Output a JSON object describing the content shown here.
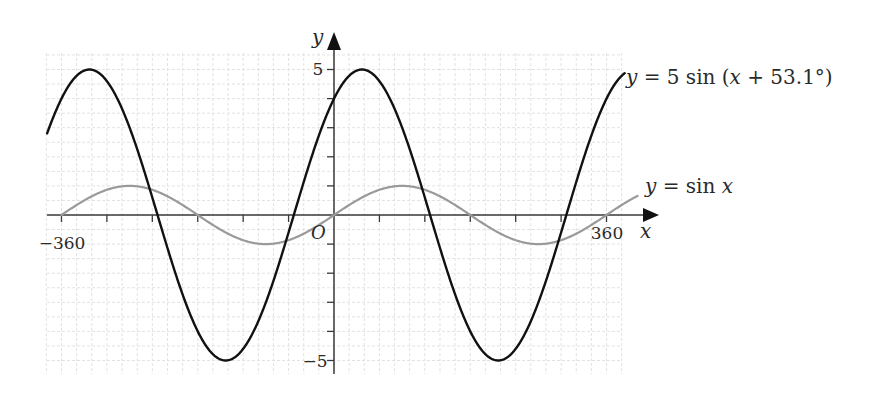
{
  "chart_data": {
    "type": "line",
    "title": "",
    "xlabel": "x",
    "ylabel": "y",
    "origin_label": "O",
    "xlim": [
      -380,
      380
    ],
    "ylim": [
      -5.5,
      5.5
    ],
    "x_tick_step_deg": 60,
    "x_tick_labels": [
      {
        "value": -360,
        "label": "−360"
      },
      {
        "value": 360,
        "label": "360"
      }
    ],
    "y_tick_step": 1,
    "y_tick_labels": [
      {
        "value": 5,
        "label": "5"
      },
      {
        "value": -5,
        "label": "−5"
      }
    ],
    "grid": {
      "on": true,
      "x_minor_deg": 20,
      "y_minor": 0.5,
      "color": "#e2e2e2"
    },
    "series": [
      {
        "name": "y = 5 sin (x + 53.1°)",
        "formula": {
          "amplitude": 5,
          "phase_deg": 53.1
        },
        "x_range": [
          -379,
          384
        ],
        "color": "#111111",
        "line_width": 2.4,
        "label_parts": [
          "y",
          " = 5 sin (",
          "x",
          " + 53.1°)"
        ],
        "sample_points": [
          {
            "x": -360,
            "y": 4.0
          },
          {
            "x": -323.1,
            "y": 5
          },
          {
            "x": -233.1,
            "y": 0
          },
          {
            "x": -143.1,
            "y": -5
          },
          {
            "x": -53.1,
            "y": 0
          },
          {
            "x": 0,
            "y": 4.0
          },
          {
            "x": 36.9,
            "y": 5
          },
          {
            "x": 126.9,
            "y": 0
          },
          {
            "x": 216.9,
            "y": -5
          },
          {
            "x": 306.9,
            "y": 0
          },
          {
            "x": 360,
            "y": 4.0
          }
        ]
      },
      {
        "name": "y = sin x",
        "formula": {
          "amplitude": 1,
          "phase_deg": 0
        },
        "x_range": [
          -360,
          401
        ],
        "color": "#9a9a9a",
        "line_width": 2.2,
        "label_parts": [
          "y",
          " = sin ",
          "x",
          ""
        ],
        "sample_points": [
          {
            "x": -360,
            "y": 0
          },
          {
            "x": -270,
            "y": 1
          },
          {
            "x": -180,
            "y": 0
          },
          {
            "x": -90,
            "y": -1
          },
          {
            "x": 0,
            "y": 0
          },
          {
            "x": 90,
            "y": 1
          },
          {
            "x": 180,
            "y": 0
          },
          {
            "x": 270,
            "y": -1
          },
          {
            "x": 360,
            "y": 0
          }
        ]
      }
    ],
    "legend_position": "inline-right"
  }
}
